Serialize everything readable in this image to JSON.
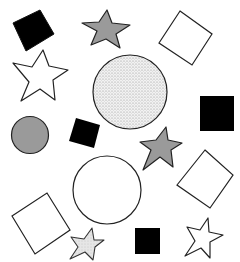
{
  "scene": {
    "width": 240,
    "height": 262,
    "background": "#ffffff",
    "colors": {
      "black": "#000000",
      "gray": "#9a9a9a",
      "white": "#ffffff",
      "dotted": "#ececec",
      "light_gray": "#e2e2e2",
      "stroke": "#222222"
    },
    "shapes": [
      {
        "id": "black-square-top-left",
        "type": "square",
        "fill": "black",
        "rotation": -25
      },
      {
        "id": "gray-star-top",
        "type": "star",
        "fill": "gray"
      },
      {
        "id": "white-diamond-top-right",
        "type": "square",
        "fill": "white",
        "rotation": 35
      },
      {
        "id": "white-star-left",
        "type": "star",
        "fill": "white"
      },
      {
        "id": "dotted-circle-large",
        "type": "circle",
        "fill": "dotted"
      },
      {
        "id": "black-square-right",
        "type": "square",
        "fill": "black",
        "rotation": 0
      },
      {
        "id": "gray-circle-left",
        "type": "circle",
        "fill": "gray"
      },
      {
        "id": "black-square-middle",
        "type": "square",
        "fill": "black",
        "rotation": 15
      },
      {
        "id": "gray-star-middle",
        "type": "star",
        "fill": "gray"
      },
      {
        "id": "white-circle-middle",
        "type": "circle",
        "fill": "white"
      },
      {
        "id": "white-diamond-right",
        "type": "square",
        "fill": "white",
        "rotation": 40
      },
      {
        "id": "white-diamond-bottom-left",
        "type": "square",
        "fill": "white",
        "rotation": -33
      },
      {
        "id": "light-star-bottom",
        "type": "star",
        "fill": "light_gray"
      },
      {
        "id": "black-square-bottom",
        "type": "square",
        "fill": "black",
        "rotation": 0
      },
      {
        "id": "white-star-bottom-right",
        "type": "star",
        "fill": "white"
      }
    ]
  }
}
